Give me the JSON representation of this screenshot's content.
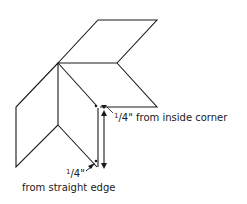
{
  "diagram": {
    "labels": {
      "inside_corner": {
        "fraction_num": "1",
        "fraction_rest": "/4\"",
        "text": " from inside corner"
      },
      "straight_edge": {
        "fraction_num": "1",
        "fraction_rest": "/4\"",
        "text": "from straight edge"
      }
    },
    "colors": {
      "line": "#1a1a1a",
      "background": "#ffffff"
    }
  }
}
